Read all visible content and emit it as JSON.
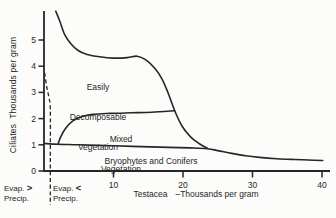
{
  "figure": {
    "background": "#fcfcfa",
    "ink": "#262626"
  },
  "chart_data": {
    "type": "line",
    "title": "",
    "xlabel": "Testacea –Thousands per gram",
    "ylabel": "Ciliates Thousands per gram",
    "xlim": [
      0,
      40
    ],
    "ylim": [
      0,
      6
    ],
    "xticks": [
      10,
      20,
      30,
      40
    ],
    "yticks": [
      0,
      1,
      2,
      3,
      4,
      5
    ],
    "grid": false,
    "legend": "none (labels inline on chart)",
    "series": [
      {
        "name": "Easily Decomposable Vegetation",
        "points": [
          [
            1.7,
            6.1
          ],
          [
            2.3,
            5.7
          ],
          [
            3.0,
            5.2
          ],
          [
            3.9,
            4.85
          ],
          [
            4.9,
            4.6
          ],
          [
            6.2,
            4.45
          ],
          [
            8.0,
            4.36
          ],
          [
            10.0,
            4.31
          ],
          [
            12.0,
            4.33
          ],
          [
            13.4,
            4.38
          ],
          [
            14.6,
            4.25
          ],
          [
            16.0,
            3.9
          ],
          [
            17.0,
            3.5
          ],
          [
            17.9,
            2.95
          ],
          [
            18.8,
            2.3
          ],
          [
            19.9,
            1.7
          ],
          [
            21.1,
            1.3
          ],
          [
            22.4,
            1.03
          ],
          [
            23.5,
            0.87
          ]
        ]
      },
      {
        "name": "Mixed Vegetation",
        "points": [
          [
            2.0,
            1.02
          ],
          [
            2.4,
            1.3
          ],
          [
            3.1,
            1.62
          ],
          [
            4.1,
            1.9
          ],
          [
            5.4,
            2.07
          ],
          [
            7.0,
            2.16
          ],
          [
            9.5,
            2.2
          ],
          [
            12.5,
            2.22
          ],
          [
            15.5,
            2.24
          ],
          [
            18.8,
            2.3
          ]
        ]
      },
      {
        "name": "Bryophytes and Conifers",
        "points": [
          [
            0,
            1.05
          ],
          [
            2,
            1.02
          ],
          [
            5,
            1.0
          ],
          [
            10,
            0.96
          ],
          [
            14,
            0.93
          ],
          [
            18,
            0.9
          ],
          [
            21,
            0.88
          ],
          [
            23.5,
            0.85
          ],
          [
            25,
            0.78
          ],
          [
            27,
            0.67
          ],
          [
            29,
            0.58
          ],
          [
            31,
            0.52
          ],
          [
            33.5,
            0.47
          ],
          [
            36,
            0.44
          ],
          [
            38,
            0.42
          ],
          [
            40.1,
            0.4
          ]
        ]
      }
    ],
    "boundary_line": {
      "style": "dashed",
      "meaning": "separates Evap. > Precip. from Evap. < Precip.",
      "points": [
        [
          0.1,
          3.75
        ],
        [
          0.4,
          3.2
        ],
        [
          0.7,
          2.8
        ],
        [
          0.9,
          2.35
        ],
        [
          0.9,
          0.5
        ],
        [
          0.9,
          -1.3
        ]
      ]
    }
  },
  "annotations": {
    "easily": {
      "lines": [
        "Easily",
        "Decomposable",
        "Vegetation"
      ]
    },
    "mixed": {
      "lines": [
        "Mixed",
        "Vegetation"
      ]
    },
    "bryophytes": {
      "text": "Bryophytes and Conifers"
    }
  },
  "axis_labels": {
    "y": "Ciliates  Thousands per gram",
    "x_name": "Testacea",
    "x_unit": "–Thousands per gram"
  },
  "footer": {
    "left": {
      "word1": "Evap.",
      "op": ">",
      "word2": "Precip."
    },
    "right": {
      "word1": "Evap.",
      "op": "<",
      "word2": "Precip."
    }
  }
}
